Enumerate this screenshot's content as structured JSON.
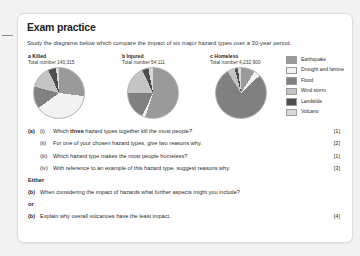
{
  "card": {
    "title": "Exam practice",
    "intro": "Study the diagrams below which compare the impact of six major hazard types over a 30-year period."
  },
  "colors": {
    "earthquake": "#9a9a9a",
    "drought_and_famine": "#f2f2f2",
    "flood": "#808080",
    "wind_storm": "#c4c4c4",
    "landslide": "#4d4d4d",
    "volcano": "#d9d9d9",
    "card_background": "#ffffff",
    "page_background": "#f2f2f2",
    "text": "#2b2b2b"
  },
  "legend": {
    "items": [
      {
        "label": "Earthquake",
        "color": "#9a9a9a"
      },
      {
        "label": "Drought and famine",
        "color": "#f2f2f2"
      },
      {
        "label": "Flood",
        "color": "#808080"
      },
      {
        "label": "Wind storm",
        "color": "#c4c4c4"
      },
      {
        "label": "Landslide",
        "color": "#4d4d4d"
      },
      {
        "label": "Volcano",
        "color": "#d9d9d9"
      }
    ]
  },
  "chart_data": [
    {
      "type": "pie",
      "id": "killed",
      "letter": "a",
      "title": "a Killed",
      "subtitle": "Total number 140,315",
      "total": "140,315",
      "categories": [
        "Earthquake",
        "Drought and famine",
        "Flood",
        "Wind storm",
        "Landslide",
        "Volcano"
      ],
      "values": [
        27,
        38,
        14,
        14,
        5,
        2
      ],
      "unit": "percent",
      "legend_position": "right"
    },
    {
      "type": "pie",
      "id": "injured",
      "letter": "b",
      "title": "b Injured",
      "subtitle": "Total number 54,111",
      "total": "54,111",
      "categories": [
        "Earthquake",
        "Drought and famine",
        "Flood",
        "Wind storm",
        "Landslide",
        "Volcano"
      ],
      "values": [
        55,
        2,
        18,
        18,
        4,
        3
      ],
      "unit": "percent",
      "legend_position": "right"
    },
    {
      "type": "pie",
      "id": "homeless",
      "letter": "c",
      "title": "c Homeless",
      "subtitle": "Total number 4,232,900",
      "total": "4,232,900",
      "categories": [
        "Earthquake",
        "Drought and famine",
        "Flood",
        "Wind storm",
        "Landslide",
        "Volcano"
      ],
      "values": [
        9,
        4,
        78,
        5,
        2,
        2
      ],
      "unit": "percent",
      "legend_position": "right"
    }
  ],
  "questions": {
    "part_a": {
      "letter": "(a)",
      "items": [
        {
          "roman": "(i)",
          "text_before": "Which ",
          "bold": "three",
          "text_after": " hazard types together kill the most people?",
          "marks": "[1]"
        },
        {
          "roman": "(ii)",
          "text_before": "For one of your chosen hazard types, give two reasons why.",
          "bold": "",
          "text_after": "",
          "marks": "[2]"
        },
        {
          "roman": "(iii)",
          "text_before": "Which hazard type makes the most people homeless?",
          "bold": "",
          "text_after": "",
          "marks": "[1]"
        },
        {
          "roman": "(iv)",
          "text_before": "With reference to an example of this hazard type, suggest reasons why.",
          "bold": "",
          "text_after": "",
          "marks": "[3]"
        }
      ]
    },
    "either_label": "Either",
    "part_b1": {
      "letter": "(b)",
      "text": "When considering the impact of hazards what further aspects might you include?",
      "marks": ""
    },
    "or_label": "or",
    "part_b2": {
      "letter": "(b)",
      "text": "Explain why overall volcanoes have the least impact.",
      "marks": "[4]"
    }
  }
}
